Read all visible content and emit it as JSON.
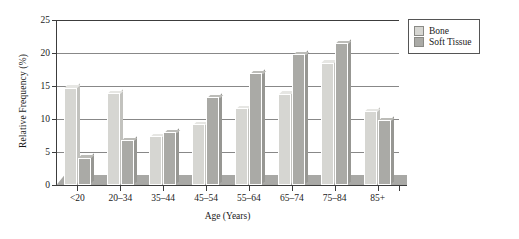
{
  "chart_data": {
    "type": "bar",
    "title": "",
    "xlabel": "Age (Years)",
    "ylabel": "Relative Frequency (%)",
    "categories": [
      "<20",
      "20–34",
      "35–44",
      "45–54",
      "55–64",
      "65–74",
      "75–84",
      "85+"
    ],
    "series": [
      {
        "name": "Bone",
        "color": "#d6d6d2",
        "values": [
          14.7,
          13.9,
          7.4,
          9.2,
          11.6,
          13.8,
          18.5,
          11.2
        ]
      },
      {
        "name": "Soft Tissue",
        "color": "#aaaaa6",
        "values": [
          4.1,
          6.8,
          8.0,
          13.3,
          16.9,
          19.8,
          21.5,
          9.8
        ]
      }
    ],
    "ylim": [
      0,
      25
    ],
    "yticks": [
      0,
      5,
      10,
      15,
      20,
      25
    ],
    "ytick_labels": [
      "0",
      "5",
      "10",
      "15",
      "20",
      "25"
    ],
    "grid": true,
    "legend_position": "top-right"
  },
  "legend": {
    "items": [
      {
        "label": "Bone"
      },
      {
        "label": "Soft Tissue"
      }
    ]
  }
}
